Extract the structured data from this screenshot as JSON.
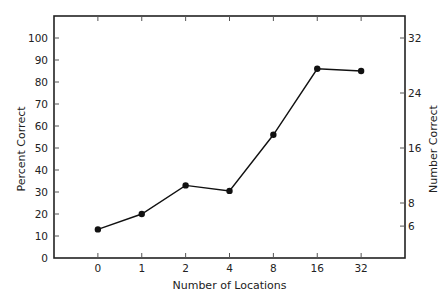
{
  "chart_data": {
    "type": "line",
    "title": "",
    "xlabel": "Number of Locations",
    "ylabel": "Percent Correct",
    "y2label": "Number Correct",
    "categories": [
      "0",
      "1",
      "2",
      "4",
      "8",
      "16",
      "32"
    ],
    "series": [
      {
        "name": "Percent Correct",
        "values": [
          13,
          20,
          33,
          30.5,
          56,
          86,
          85
        ],
        "marker": "circle",
        "color": "#111111"
      }
    ],
    "ylim": [
      0,
      100
    ],
    "yticks": [
      0,
      10,
      20,
      30,
      40,
      50,
      60,
      70,
      80,
      90,
      100
    ],
    "y2ticks": [
      {
        "label": "32",
        "at_percent": 100
      },
      {
        "label": "24",
        "at_percent": 75
      },
      {
        "label": "16",
        "at_percent": 50
      },
      {
        "label": "8",
        "at_percent": 25
      },
      {
        "label": "6",
        "at_percent": 14.5
      }
    ],
    "xlim_padding_categories": 1,
    "grid": false,
    "top_ticks": true,
    "legend": "none"
  }
}
